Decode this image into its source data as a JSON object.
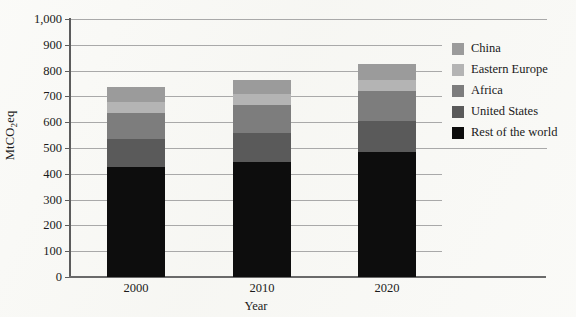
{
  "chart_data": {
    "type": "bar",
    "subtype": "stacked-bar",
    "title": "",
    "xlabel": "Year",
    "ylabel": "MtCO2eq",
    "ylabel_prefix": "MtCO",
    "ylabel_sub": "2",
    "ylabel_suffix": "eq",
    "categories": [
      "2000",
      "2010",
      "2020"
    ],
    "ylim": [
      0,
      1000
    ],
    "ytick_step": 100,
    "yticks": [
      "0",
      "100",
      "200",
      "300",
      "400",
      "500",
      "600",
      "700",
      "800",
      "900",
      "1,000"
    ],
    "grid": true,
    "grid_axis": "y",
    "legend_position": "right",
    "series": [
      {
        "name": "Rest of the world",
        "color": "#0d0d0d",
        "values": [
          425,
          445,
          485
        ]
      },
      {
        "name": "United States",
        "color": "#5a5a5a",
        "values": [
          110,
          115,
          120
        ]
      },
      {
        "name": "Africa",
        "color": "#7d7d7d",
        "values": [
          100,
          105,
          115
        ]
      },
      {
        "name": "Eastern Europe",
        "color": "#b4b4b4",
        "values": [
          45,
          45,
          45
        ]
      },
      {
        "name": "China",
        "color": "#9b9b9b",
        "values": [
          55,
          55,
          60
        ]
      }
    ],
    "totals": [
      735,
      765,
      825
    ],
    "legend_order": [
      "China",
      "Eastern Europe",
      "Africa",
      "United States",
      "Rest of the world"
    ],
    "legend_colors": [
      "#9b9b9b",
      "#b4b4b4",
      "#7d7d7d",
      "#5a5a5a",
      "#0d0d0d"
    ]
  }
}
